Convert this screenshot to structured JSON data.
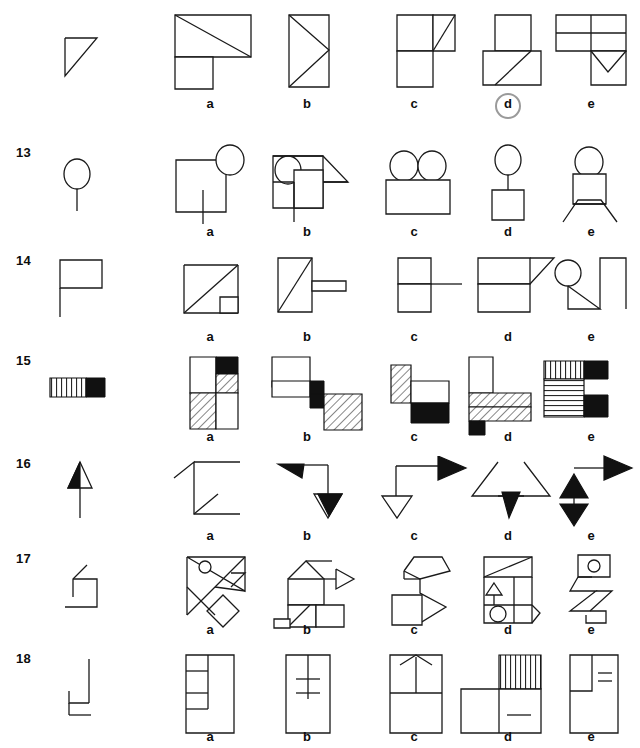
{
  "page": {
    "kind": "spatial-reasoning-test-sheet",
    "background": "#ffffff",
    "ink": "#1a1a1a",
    "highlight_color": "#9a9a9a",
    "width": 640,
    "height": 748
  },
  "option_labels": [
    "a",
    "b",
    "c",
    "d",
    "e"
  ],
  "marked_answer": {
    "row": "12",
    "option": "d",
    "style": "circled"
  },
  "rows": [
    {
      "number": "",
      "prompt_shape": "right-triangle-open",
      "options": [
        {
          "label": "a",
          "description": "rectangle with diagonal on top, square below-left"
        },
        {
          "label": "b",
          "description": "tall rectangle with zigzag diagonals"
        },
        {
          "label": "c",
          "description": "two stacked squares with small triangle top-right"
        },
        {
          "label": "d",
          "description": "square on top, rectangle below-right with diagonal"
        },
        {
          "label": "e",
          "description": "two stacked rectangles with notch triangle and square below"
        }
      ]
    },
    {
      "number": "13",
      "prompt_shape": "circle-on-stick (balloon)",
      "options": [
        {
          "label": "a",
          "description": "square with circle at top-right corner and inner stick"
        },
        {
          "label": "b",
          "description": "square with circle top-left, triangle right, inner square"
        },
        {
          "label": "c",
          "description": "two circles on a wide rectangle"
        },
        {
          "label": "d",
          "description": "circle on stick above a square"
        },
        {
          "label": "e",
          "description": "circle above square with crossed legs"
        }
      ]
    },
    {
      "number": "14",
      "prompt_shape": "flag (rectangle on pole)",
      "options": [
        {
          "label": "a",
          "description": "square with diagonal and small square bottom-right"
        },
        {
          "label": "b",
          "description": "rectangle with diagonal plus small horizontal bar right"
        },
        {
          "label": "c",
          "description": "two stacked squares with horizontal line extending right"
        },
        {
          "label": "d",
          "description": "two stacked rectangles with triangle top-right"
        },
        {
          "label": "e",
          "description": "circle, diagonal triangle, open rectangle right"
        }
      ]
    },
    {
      "number": "15",
      "prompt_shape": "vertically-striped bar with black square",
      "options": [
        {
          "label": "a",
          "description": "2x2 grid: white, black; hatched, hatched/white"
        },
        {
          "label": "b",
          "description": "white rectangle, small black square, large hatched square"
        },
        {
          "label": "c",
          "description": "hatched tall cell, white cell, black cell"
        },
        {
          "label": "d",
          "description": "white tall rect, hatched band, black small square"
        },
        {
          "label": "e",
          "description": "vertical stripes, black, horizontal stripes, black"
        }
      ]
    },
    {
      "number": "16",
      "prompt_shape": "arrow pointing up, half-filled head",
      "options": [
        {
          "label": "a",
          "description": "open polyline bracket with small diagonal"
        },
        {
          "label": "b",
          "description": "black left arrowhead, line, open down arrowhead"
        },
        {
          "label": "c",
          "description": "line with black right arrowhead and open down arrowhead"
        },
        {
          "label": "d",
          "description": "two open triangles with black down arrowhead"
        },
        {
          "label": "e",
          "description": "black up arrow, black down arrow, black right arrow"
        }
      ]
    },
    {
      "number": "17",
      "prompt_shape": "open zigzag hook",
      "options": [
        {
          "label": "a",
          "description": "tangram-like triangles with small circle and diamond"
        },
        {
          "label": "b",
          "description": "house with right arrow, squares and small tab"
        },
        {
          "label": "c",
          "description": "pentagon, zigzag arrow, square"
        },
        {
          "label": "d",
          "description": "rectangle with diagonal, small triangle, circle"
        },
        {
          "label": "e",
          "description": "square with circle above a zigzag ribbon"
        }
      ]
    },
    {
      "number": "18",
      "prompt_shape": "stepped open line",
      "options": [
        {
          "label": "a",
          "description": "tall rectangle with left column divided into cells"
        },
        {
          "label": "b",
          "description": "tall rectangle with centre line and two crossbars"
        },
        {
          "label": "c",
          "description": "tall rectangle split, arrow at top"
        },
        {
          "label": "d",
          "description": "wide rectangle with striped block on top right"
        },
        {
          "label": "e",
          "description": "tall rectangle with inner box and two short bars"
        }
      ]
    }
  ]
}
